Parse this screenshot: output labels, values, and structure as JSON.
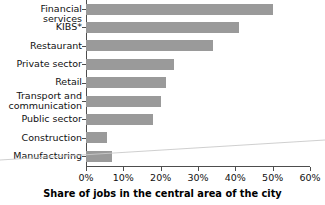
{
  "chart_data": {
    "type": "bar",
    "orientation": "horizontal",
    "title": "",
    "xlabel": "Share of jobs in the central area of the city",
    "ylabel": "",
    "categories": [
      "Financial services",
      "KIBS*",
      "Restaurant",
      "Private sector",
      "Retail",
      "Transport and\ncommunication",
      "Public sector",
      "Construction",
      "Manufacturing"
    ],
    "values": [
      50,
      41,
      34,
      23.5,
      21.5,
      20,
      18,
      5.5,
      7
    ],
    "value_labels": [
      "50%",
      "41%",
      "34%",
      "23.5%",
      "21.5%",
      "20%",
      "18%",
      "5.5%",
      "7%"
    ],
    "xlim": [
      0,
      60
    ],
    "xticks": [
      0,
      10,
      20,
      30,
      40,
      50,
      60
    ],
    "xtick_labels": [
      "0%",
      "10%",
      "20%",
      "30%",
      "40%",
      "50%",
      "60%"
    ],
    "grid": false,
    "legend": false,
    "bar_color": "#9a9a9a",
    "axis_color": "#4d4d4d",
    "text_color": "#111111"
  }
}
